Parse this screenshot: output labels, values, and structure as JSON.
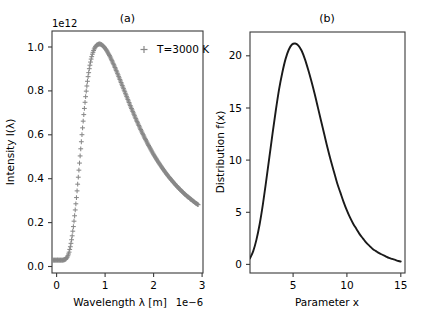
{
  "figure": {
    "width": 423,
    "height": 325,
    "background": "#ffffff"
  },
  "panel_a": {
    "title": "(a)",
    "xlabel": "Wavelength λ [m]",
    "ylabel": "Intensity I(λ)",
    "x_offset_text": "1e−6",
    "y_offset_text": "1e12",
    "legend_label": "T=3000 K",
    "legend_marker": "plus-marker",
    "marker_color": "#888888",
    "xticks": [
      "0",
      "1",
      "2",
      "3"
    ],
    "yticks": [
      "0.0",
      "0.2",
      "0.4",
      "0.6",
      "0.8",
      "1.0"
    ]
  },
  "panel_b": {
    "title": "(b)",
    "xlabel": "Parameter x",
    "ylabel": "Distribution f(x)",
    "line_color": "#1a1a1a",
    "xticks": [
      "5",
      "10",
      "15"
    ],
    "yticks": [
      "0",
      "5",
      "10",
      "15",
      "20"
    ]
  },
  "chart_data": [
    {
      "type": "scatter",
      "title": "(a)",
      "xlabel": "Wavelength λ [m]",
      "ylabel": "Intensity I(λ)",
      "x_scale_offset": "1e-6",
      "y_scale_offset": "1e12",
      "xlim": [
        0,
        3.1
      ],
      "ylim": [
        -0.06,
        1.06
      ],
      "xticks": [
        0,
        1,
        2,
        3
      ],
      "yticks": [
        0.0,
        0.2,
        0.4,
        0.6,
        0.8,
        1.0
      ],
      "grid": false,
      "legend": {
        "position": "upper right",
        "entries": [
          "T=3000 K"
        ]
      },
      "marker": "+",
      "color": "#888888",
      "series": [
        {
          "name": "T=3000 K",
          "x": [
            0.02,
            0.05,
            0.08,
            0.11,
            0.14,
            0.17,
            0.2,
            0.23,
            0.26,
            0.29,
            0.32,
            0.35,
            0.38,
            0.41,
            0.44,
            0.47,
            0.5,
            0.53,
            0.56,
            0.59,
            0.62,
            0.65,
            0.68,
            0.71,
            0.74,
            0.77,
            0.8,
            0.83,
            0.86,
            0.89,
            0.92,
            0.95,
            0.98,
            1.01,
            1.04,
            1.07,
            1.1,
            1.13,
            1.16,
            1.19,
            1.22,
            1.25,
            1.28,
            1.31,
            1.34,
            1.37,
            1.4,
            1.43,
            1.46,
            1.49,
            1.52,
            1.55,
            1.58,
            1.61,
            1.64,
            1.67,
            1.7,
            1.73,
            1.76,
            1.79,
            1.82,
            1.85,
            1.88,
            1.91,
            1.94,
            1.97,
            2.0,
            2.03,
            2.06,
            2.09,
            2.12,
            2.15,
            2.18,
            2.21,
            2.24,
            2.27,
            2.3,
            2.33,
            2.36,
            2.39,
            2.42,
            2.45,
            2.48,
            2.51,
            2.54,
            2.57,
            2.6,
            2.63,
            2.66,
            2.69,
            2.72,
            2.75,
            2.78,
            2.81,
            2.84,
            2.87,
            2.9,
            2.93,
            2.96,
            3.0
          ],
          "y": [
            0.0,
            0.0,
            0.0,
            0.0,
            0.0,
            0.0,
            0.0,
            0.0,
            0.002,
            0.006,
            0.016,
            0.035,
            0.065,
            0.105,
            0.156,
            0.216,
            0.284,
            0.358,
            0.436,
            0.515,
            0.593,
            0.667,
            0.735,
            0.796,
            0.848,
            0.892,
            0.927,
            0.954,
            0.974,
            0.987,
            0.995,
            0.999,
            1.0,
            0.998,
            0.993,
            0.986,
            0.977,
            0.967,
            0.955,
            0.942,
            0.928,
            0.913,
            0.898,
            0.882,
            0.866,
            0.849,
            0.832,
            0.815,
            0.798,
            0.781,
            0.764,
            0.747,
            0.73,
            0.713,
            0.697,
            0.681,
            0.665,
            0.649,
            0.634,
            0.619,
            0.604,
            0.59,
            0.576,
            0.562,
            0.549,
            0.536,
            0.523,
            0.511,
            0.499,
            0.487,
            0.476,
            0.465,
            0.454,
            0.444,
            0.434,
            0.424,
            0.414,
            0.405,
            0.396,
            0.387,
            0.379,
            0.371,
            0.363,
            0.355,
            0.347,
            0.34,
            0.333,
            0.326,
            0.319,
            0.313,
            0.306,
            0.3,
            0.294,
            0.289,
            0.283,
            0.278,
            0.272,
            0.267,
            0.262,
            0.256
          ]
        }
      ],
      "notes": "Planck blackbody spectrum at T=3000 K; peak ~1.0e12 near lambda = 0.97e-6 m; values are in units of 1e12, x in units of 1e-6 m"
    },
    {
      "type": "line",
      "title": "(b)",
      "xlabel": "Parameter x",
      "ylabel": "Distribution f(x)",
      "xlim": [
        1,
        15.4
      ],
      "ylim": [
        -0.8,
        22.3
      ],
      "xticks": [
        5,
        10,
        15
      ],
      "yticks": [
        0,
        5,
        10,
        15,
        20
      ],
      "grid": false,
      "color": "#1a1a1a",
      "series": [
        {
          "name": "f(x)",
          "x": [
            1.0,
            1.3,
            1.6,
            1.9,
            2.2,
            2.5,
            2.8,
            3.1,
            3.4,
            3.7,
            4.0,
            4.3,
            4.6,
            4.9,
            5.2,
            5.5,
            5.8,
            6.1,
            6.4,
            6.7,
            7.0,
            7.3,
            7.6,
            7.9,
            8.2,
            8.5,
            8.8,
            9.1,
            9.4,
            9.7,
            10.0,
            10.3,
            10.6,
            10.9,
            11.2,
            11.5,
            11.8,
            12.1,
            12.4,
            12.7,
            13.0,
            13.3,
            13.6,
            13.9,
            14.2,
            14.5,
            14.8,
            15.0
          ],
          "y": [
            0.6,
            1.3,
            2.4,
            3.9,
            5.8,
            8.0,
            10.3,
            12.6,
            14.8,
            16.8,
            18.4,
            19.7,
            20.6,
            21.1,
            21.2,
            21.0,
            20.5,
            19.7,
            18.7,
            17.6,
            16.4,
            15.1,
            13.8,
            12.5,
            11.2,
            10.0,
            8.9,
            7.8,
            6.9,
            6.0,
            5.2,
            4.5,
            3.9,
            3.4,
            2.9,
            2.5,
            2.1,
            1.8,
            1.5,
            1.3,
            1.1,
            0.95,
            0.8,
            0.65,
            0.55,
            0.45,
            0.35,
            0.3
          ]
        }
      ],
      "notes": "Smooth unimodal skewed distribution peaking at f(x) ≈ 21.2 near x ≈ 5, decaying to near 0 at x = 15"
    }
  ]
}
